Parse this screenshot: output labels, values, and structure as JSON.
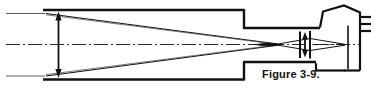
{
  "figure": {
    "caption": "Figure 3-9.",
    "type": "optical-ray-diagram",
    "ink_color": "#111111",
    "background_color": "#ffffff",
    "parts": {
      "tube_large_label": "large-diameter-tube-section",
      "tube_small_label": "small-diameter-tube-section",
      "entrance_aperture_dimension": "entrance-aperture-height-arrow",
      "image_height_dimension": "image-height-arrow",
      "optical_axis": "optical-axis-centerline",
      "ray_bundle": "converging-ray-bundle",
      "lens_group": "lens-element-group",
      "detector_housing": "angled-detector-housing",
      "terminal_contacts": "terminal-contact-ticks"
    }
  }
}
